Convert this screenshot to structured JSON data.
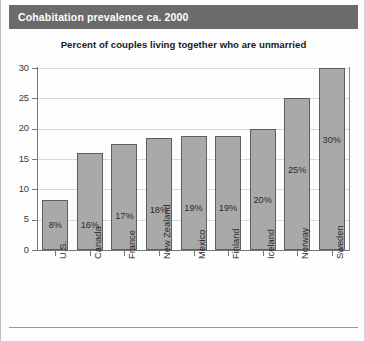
{
  "banner": {
    "title": "Cohabitation prevalence ca. 2000",
    "background_color": "#6b6b6b",
    "text_color": "#ffffff"
  },
  "chart_data": {
    "type": "bar",
    "title": "Cohabitation prevalence ca. 2000",
    "subtitle": "Percent of couples living together who are unmarried",
    "xlabel": "",
    "ylabel": "",
    "ylim": [
      0,
      30
    ],
    "yticks": [
      0,
      5,
      10,
      15,
      20,
      25,
      30
    ],
    "ytick_labels": [
      "0",
      "5",
      "10",
      "15",
      "20",
      "25",
      "30"
    ],
    "grid": true,
    "legend": false,
    "bar_color": "#a9a9a9",
    "bar_edge_color": "#5e5e5e",
    "categories": [
      "U.S.",
      "Canada",
      "France",
      "New Zealand",
      "Mexico",
      "Finland",
      "Iceland",
      "Norway",
      "Sweden"
    ],
    "values": [
      8.3,
      16.0,
      17.5,
      18.5,
      18.8,
      18.8,
      20.0,
      25.0,
      30.0
    ],
    "data_labels": [
      "8%",
      "16%",
      "17%",
      "18%",
      "19%",
      "19%",
      "20%",
      "25%",
      "30%"
    ]
  },
  "footer": {
    "rule": ""
  }
}
